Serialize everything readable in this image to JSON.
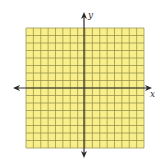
{
  "diagram": {
    "type": "coordinate-plane",
    "x_axis_label": "x",
    "y_axis_label": "y",
    "grid": {
      "columns": 16,
      "rows": 16,
      "left": 26,
      "top": 28,
      "width": 118,
      "height": 120
    },
    "axes": {
      "origin_x": 84,
      "origin_y": 88,
      "x_start": 13,
      "x_end": 152,
      "y_start": 12,
      "y_end": 158
    },
    "colors": {
      "grid_fill": "#f8ef8a",
      "grid_line": "#8e8a48",
      "axis": "#2b2b2b",
      "label": "#333333"
    }
  }
}
